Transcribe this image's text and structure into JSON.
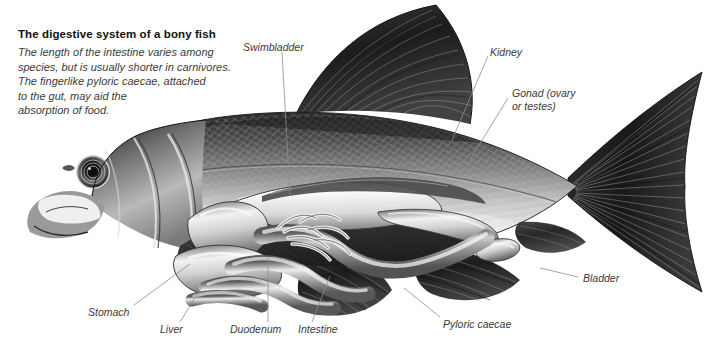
{
  "figure": {
    "kind": "anatomical-illustration",
    "background_color": "#ffffff",
    "style": "grayscale pen-and-ink / airbrush scientific illustration",
    "title": "The digestive system of a bony fish",
    "description_lines": [
      "The length of the intestine varies among",
      "species, but is usually shorter in carnivores.",
      "The fingerlike pyloric caecae, attached",
      "to the gut, may aid the",
      "absorption of food."
    ],
    "title_color": "#111111",
    "description_color": "#3c3c3c",
    "label_color": "#3a3a3a",
    "leader_color": "#8e8e8e"
  },
  "labels": [
    {
      "id": "swimbladder",
      "text": "Swimbladder",
      "x": 243,
      "y": 41,
      "leader": [
        [
          241,
          52
        ],
        [
          224,
          64
        ],
        [
          224,
          64
        ]
      ]
    },
    {
      "id": "kidney",
      "text": "Kidney",
      "x": 490,
      "y": 46,
      "leader": [
        [
          488,
          56
        ],
        [
          452,
          86
        ]
      ]
    },
    {
      "id": "gonad",
      "line1": "Gonad (ovary",
      "line2": "or testes)",
      "text": "Gonad (ovary or testes)",
      "x": 512,
      "y": 87,
      "leader": [
        [
          510,
          97
        ],
        [
          470,
          118
        ]
      ]
    },
    {
      "id": "bladder",
      "text": "Bladder",
      "x": 583,
      "y": 280,
      "leader": [
        [
          580,
          283
        ],
        [
          545,
          275
        ]
      ]
    },
    {
      "id": "pyloric-caecae",
      "text": "Pyloric caecae",
      "x": 443,
      "y": 320,
      "leader": [
        [
          441,
          318
        ],
        [
          412,
          293
        ]
      ]
    },
    {
      "id": "intestine",
      "text": "Intestine",
      "x": 298,
      "y": 330,
      "leader": [
        [
          310,
          325
        ],
        [
          327,
          283
        ]
      ]
    },
    {
      "id": "duodenum",
      "text": "Duodenum",
      "x": 232,
      "y": 330,
      "leader": [
        [
          268,
          325
        ],
        [
          268,
          270
        ]
      ]
    },
    {
      "id": "liver",
      "text": "Liver",
      "x": 162,
      "y": 330,
      "leader": [
        [
          178,
          325
        ],
        [
          202,
          285
        ]
      ]
    },
    {
      "id": "stomach",
      "text": "Stomach",
      "x": 88,
      "y": 313,
      "leader": [
        [
          130,
          308
        ],
        [
          184,
          268
        ]
      ]
    }
  ],
  "anatomy_parts": [
    "swimbladder",
    "kidney",
    "gonad",
    "bladder",
    "pyloric caecae",
    "intestine",
    "duodenum",
    "liver",
    "stomach",
    "dorsal fin",
    "caudal fin",
    "anal fin",
    "pelvic fin",
    "pectoral fin",
    "eye",
    "mouth",
    "operculum",
    "scales"
  ]
}
